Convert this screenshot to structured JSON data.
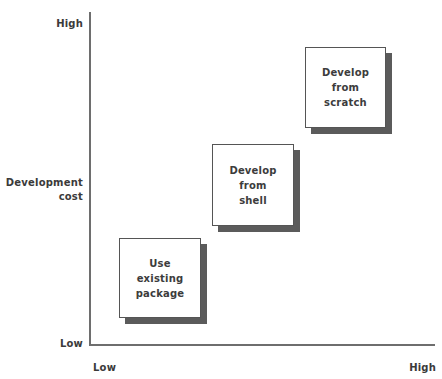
{
  "chart_data": {
    "type": "diagram",
    "title": "",
    "xlabel": "",
    "ylabel": "Development cost",
    "axes": {
      "y": {
        "label_line1": "Development",
        "label_line2": "cost",
        "low": "Low",
        "high": "High"
      },
      "x": {
        "label": "",
        "low": "Low",
        "high": "High"
      }
    },
    "steps": [
      {
        "id": "use-existing-package",
        "text": "Use\nexisting\npackage",
        "x_level": "low",
        "y_level": "low"
      },
      {
        "id": "develop-from-shell",
        "text": "Develop\nfrom\nshell",
        "x_level": "medium",
        "y_level": "medium"
      },
      {
        "id": "develop-from-scratch",
        "text": "Develop\nfrom\nscratch",
        "x_level": "high",
        "y_level": "high"
      }
    ]
  },
  "axis": {
    "y_high": "High",
    "y_low": "Low",
    "y_title_line1": "Development",
    "y_title_line2": "cost",
    "x_low": "Low",
    "x_high": "High"
  },
  "boxes": {
    "box1": "Use\nexisting\npackage",
    "box2": "Develop\nfrom\nshell",
    "box3": "Develop\nfrom\nscratch"
  },
  "colors": {
    "axis": "#6e6e6e",
    "box_border": "#555555",
    "box_fill": "#ffffff",
    "shadow": "#5b5b5b",
    "text": "#3c3c3c",
    "background": "#ffffff"
  }
}
